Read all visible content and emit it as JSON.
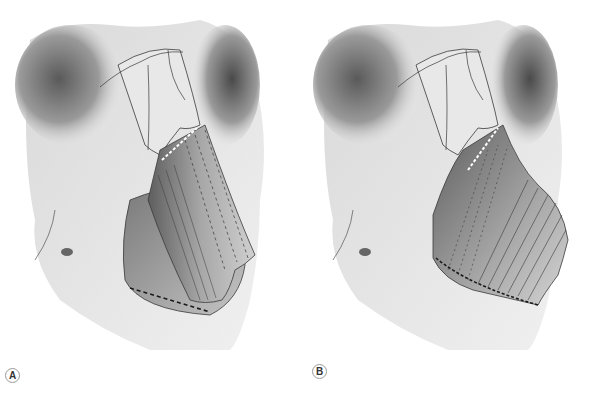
{
  "figure": {
    "panels": [
      {
        "label": "A",
        "implant_style": "narrow rectangular implant, dashed upper segment, inferior dashed osteotomy line"
      },
      {
        "label": "B",
        "implant_style": "broad flared implant extending to the piriform aperture, dashed inferior border"
      }
    ],
    "colors": {
      "background": "#ffffff",
      "bone_light": "#e6e6e6",
      "bone_mid": "#bdbdbd",
      "bone_dark": "#6e6e6e",
      "outline": "#3a3a3a",
      "implant": "#9e9e9e"
    }
  }
}
